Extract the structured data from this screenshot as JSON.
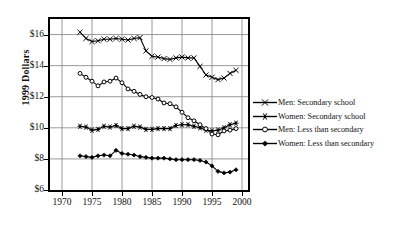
{
  "chart_data": {
    "type": "line",
    "title": "",
    "xlabel": "",
    "ylabel": "1999 Dollars",
    "xlim": [
      1968,
      2001
    ],
    "ylim": [
      6,
      17
    ],
    "xticks": [
      1970,
      1975,
      1980,
      1985,
      1990,
      1995,
      2000
    ],
    "yticks": [
      6,
      8,
      10,
      12,
      14,
      16
    ],
    "ytick_labels": [
      "$6",
      "$8",
      "$10",
      "$12",
      "$14",
      "$16"
    ],
    "xtick_labels": [
      "1970",
      "1975",
      "1980",
      "1985",
      "1990",
      "1995",
      "2000"
    ],
    "grid": true,
    "legend_position": "right",
    "x": [
      1973,
      1974,
      1975,
      1976,
      1977,
      1978,
      1979,
      1980,
      1981,
      1982,
      1983,
      1984,
      1985,
      1986,
      1987,
      1988,
      1989,
      1990,
      1991,
      1992,
      1993,
      1994,
      1995,
      1996,
      1997,
      1998,
      1999
    ],
    "series": [
      {
        "name": "Men:  Secondary school",
        "marker": "x",
        "values": [
          16.15,
          15.75,
          15.55,
          15.6,
          15.7,
          15.7,
          15.75,
          15.7,
          15.65,
          15.75,
          15.8,
          14.95,
          14.6,
          14.55,
          14.45,
          14.4,
          14.5,
          14.55,
          14.5,
          14.5,
          13.95,
          13.4,
          13.25,
          13.1,
          13.2,
          13.5,
          13.7
        ]
      },
      {
        "name": "Women: Secondary school",
        "marker": "star",
        "values": [
          10.1,
          10.05,
          9.85,
          9.9,
          10.1,
          10.05,
          10.15,
          9.95,
          9.95,
          10.1,
          10.05,
          9.9,
          9.9,
          9.95,
          9.95,
          9.95,
          10.15,
          10.2,
          10.2,
          10.1,
          10.0,
          9.85,
          9.8,
          9.85,
          10.0,
          10.2,
          10.3
        ]
      },
      {
        "name": "Men:  Less than secondary",
        "marker": "o",
        "values": [
          13.5,
          13.25,
          13.0,
          12.7,
          12.95,
          13.0,
          13.2,
          12.9,
          12.5,
          12.35,
          12.15,
          12.0,
          11.95,
          11.85,
          11.6,
          11.55,
          11.35,
          11.0,
          10.65,
          10.45,
          10.2,
          9.95,
          9.6,
          9.55,
          9.8,
          9.85,
          9.95
        ]
      },
      {
        "name": "Women: Less than secondary",
        "marker": "diamond",
        "values": [
          8.2,
          8.15,
          8.1,
          8.2,
          8.25,
          8.2,
          8.55,
          8.35,
          8.3,
          8.25,
          8.15,
          8.1,
          8.05,
          8.05,
          8.05,
          8.0,
          7.95,
          7.95,
          7.95,
          7.95,
          7.9,
          7.8,
          7.55,
          7.2,
          7.1,
          7.15,
          7.3
        ]
      }
    ]
  },
  "legend": {
    "items": [
      {
        "label": "Men:  Secondary school",
        "marker": "x"
      },
      {
        "label": "Women: Secondary school",
        "marker": "star"
      },
      {
        "label": "Men:  Less than secondary",
        "marker": "o"
      },
      {
        "label": "Women: Less than secondary",
        "marker": "diamond"
      }
    ]
  },
  "colors": {
    "line": "#000000",
    "grid": "#808080",
    "frame": "#000000",
    "background": "#ffffff"
  }
}
